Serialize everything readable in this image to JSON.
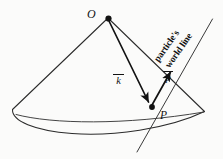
{
  "figure": {
    "name": "light-cone-diagram",
    "background_color": "#fbfbfa",
    "ink_color": "#121212",
    "width": 223,
    "height": 159
  },
  "labels": {
    "origin_point": "O",
    "event_point": "P",
    "wave_vector": "k",
    "momentum_vector": "p",
    "worldline_line1": "particle's",
    "worldline_line2": "world line"
  },
  "geometry": {
    "apex": {
      "x": 108,
      "y": 18
    },
    "event": {
      "x": 152,
      "y": 107
    },
    "cone_left_base": {
      "x": 12,
      "y": 110
    },
    "cone_right_base": {
      "x": 205,
      "y": 112
    },
    "base_ellipse_bottom": {
      "x": 112,
      "y": 131
    },
    "worldline_top": {
      "x": 212,
      "y": 20
    },
    "worldline_bottom": {
      "x": 138,
      "y": 152
    }
  }
}
